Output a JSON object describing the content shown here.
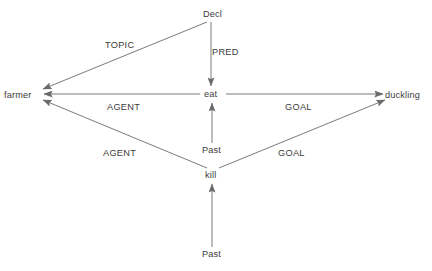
{
  "diagram": {
    "line_color": "#6b6b6b",
    "text_color": "#3b3b3b",
    "background": "#ffffff",
    "nodes": [
      {
        "id": "decl",
        "label": "Decl",
        "x": 215,
        "y": 14
      },
      {
        "id": "eat",
        "label": "eat",
        "x": 213,
        "y": 94
      },
      {
        "id": "farmer",
        "label": "farmer",
        "x": 22,
        "y": 95
      },
      {
        "id": "duckling",
        "label": "duckling",
        "x": 407,
        "y": 95
      },
      {
        "id": "past_eat",
        "label": "Past",
        "x": 213,
        "y": 150
      },
      {
        "id": "kill",
        "label": "kill",
        "x": 212,
        "y": 175
      },
      {
        "id": "past_kill",
        "label": "Past",
        "x": 213,
        "y": 254
      }
    ],
    "edges": [
      {
        "id": "decl-farmer",
        "from": "decl",
        "to": "farmer",
        "label": "TOPIC",
        "label_x": 105,
        "label_y": 45
      },
      {
        "id": "decl-eat",
        "from": "decl",
        "to": "eat",
        "label": "PRED",
        "label_x": 212,
        "label_y": 52
      },
      {
        "id": "eat-farmer",
        "from": "eat",
        "to": "farmer",
        "label": "AGENT",
        "label_x": 107,
        "label_y": 107
      },
      {
        "id": "eat-duckling",
        "from": "eat",
        "to": "duckling",
        "label": "GOAL",
        "label_x": 285,
        "label_y": 107
      },
      {
        "id": "past-eat",
        "from": "past_eat",
        "to": "eat",
        "label": "",
        "label_x": 0,
        "label_y": 0
      },
      {
        "id": "kill-farmer",
        "from": "kill",
        "to": "farmer",
        "label": "AGENT",
        "label_x": 103,
        "label_y": 153
      },
      {
        "id": "kill-duckling",
        "from": "kill",
        "to": "duckling",
        "label": "GOAL",
        "label_x": 278,
        "label_y": 153
      },
      {
        "id": "past-kill",
        "from": "past_kill",
        "to": "kill",
        "label": "",
        "label_x": 0,
        "label_y": 0
      }
    ]
  }
}
